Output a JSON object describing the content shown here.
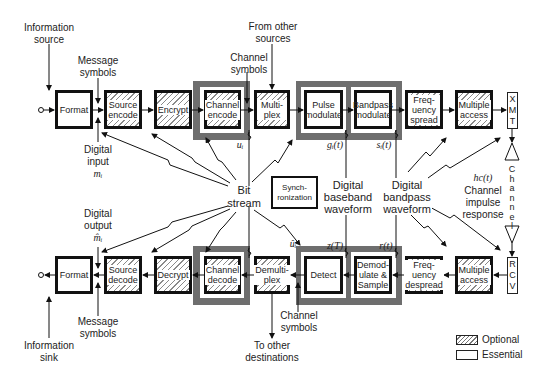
{
  "legend": {
    "optional": "Optional",
    "essential": "Essential"
  },
  "transmit_chain": {
    "format": "Format",
    "source_encode": "Source encode",
    "encrypt": "Encrypt",
    "channel_encode": "Channel encode",
    "multiplex": "Multi- plex",
    "pulse_modulate": "Pulse modulate",
    "bandpass_modulate": "Bandpass modulate",
    "frequency_spread": "Freq- uency spread",
    "multiple_access": "Multiple access",
    "xmt": [
      "X",
      "M",
      "T"
    ]
  },
  "receive_chain": {
    "format": "Format",
    "source_decode": "Source decode",
    "decrypt": "Decrypt",
    "channel_decode": "Channel decode",
    "demultiplex": "Demulti- plex",
    "detect": "Detect",
    "demodulate_sample": "Demod- ulate & Sample",
    "frequency_despread": "Freq- uency despread",
    "multiple_access": "Multiple access",
    "rcv": [
      "R",
      "C",
      "V"
    ]
  },
  "center": {
    "synchronization": "Synch- ronization",
    "bit_stream": "Bit stream",
    "digital_baseband_waveform": "Digital baseband waveform",
    "digital_bandpass_waveform": "Digital bandpass waveform"
  },
  "annotations": {
    "information_source": "Information source",
    "message_symbols_top": "Message symbols",
    "channel_symbols_top": "Channel symbols",
    "from_other_sources": "From other sources",
    "digital_input": "Digital input",
    "digital_input_symbol": "mᵢ",
    "digital_output": "Digital output",
    "digital_output_symbol": "m̂ᵢ",
    "message_symbols_bottom": "Message symbols",
    "information_sink": "Information sink",
    "channel_symbols_bottom": "Channel symbols",
    "to_other_destinations": "To other destinations",
    "u_i": "uᵢ",
    "u_i_hat": "ûᵢ",
    "g_i_t": "gᵢ(t)",
    "s_i_t": "sᵢ(t)",
    "z_T": "z(T)",
    "r_t": "r(t)",
    "channel_impulse_symbol": "hс(t)",
    "channel_impulse_response": "Channel impulse response",
    "channel_vertical": [
      "C",
      "h",
      "a",
      "n",
      "n",
      "e",
      "l"
    ]
  }
}
